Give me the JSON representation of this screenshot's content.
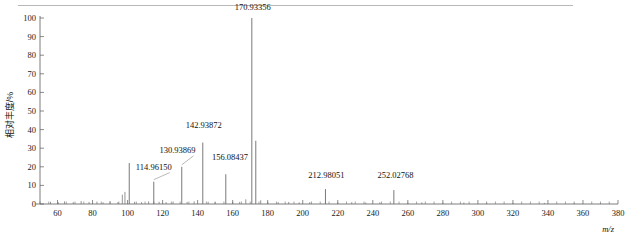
{
  "figure": {
    "name": "mass-spectrum",
    "background": "#ffffff",
    "line_color": "#7a7a7a",
    "text_color": "#111111"
  },
  "chart_data": {
    "type": "bar",
    "title": "",
    "subtitle": "",
    "xlabel": "m/z",
    "ylabel": "相对丰度/%",
    "xlim": [
      50,
      380
    ],
    "ylim": [
      0,
      100
    ],
    "grid": false,
    "legend": null,
    "x_ticks": [
      60,
      80,
      100,
      120,
      140,
      160,
      180,
      200,
      220,
      240,
      260,
      280,
      300,
      320,
      340,
      360,
      380
    ],
    "x_minor_step": 5,
    "y_ticks": [
      0,
      10,
      20,
      30,
      40,
      50,
      60,
      70,
      80,
      90,
      100
    ],
    "x": [
      56.0,
      60.5,
      64.0,
      69.0,
      73.5,
      78.0,
      82.5,
      86.0,
      90.0,
      94.5,
      97.0,
      98.5,
      100.95,
      104.0,
      108.0,
      112.0,
      114.9615,
      118.0,
      122.0,
      126.0,
      130.93869,
      134.0,
      138.0,
      142.93872,
      146.0,
      150.0,
      156.08437,
      160.0,
      164.0,
      167.5,
      170.93356,
      173.2,
      176.0,
      180.0,
      186.0,
      192.0,
      198.0,
      204.0,
      212.98051,
      220.0,
      228.0,
      236.0,
      244.0,
      252.02768,
      260.0,
      268.0,
      280.0,
      292.0,
      305.0,
      320.0,
      338.0,
      355.0,
      370.0
    ],
    "values": [
      1.2,
      0.9,
      1.4,
      1.0,
      1.6,
      1.1,
      1.3,
      0.9,
      1.5,
      1.0,
      5.0,
      6.5,
      22.0,
      1.2,
      1.0,
      1.4,
      12.0,
      1.2,
      1.0,
      1.3,
      20.0,
      1.1,
      1.4,
      33.0,
      1.2,
      1.0,
      16.0,
      1.2,
      1.1,
      2.5,
      100.0,
      34.0,
      2.0,
      1.2,
      1.0,
      1.1,
      0.9,
      1.0,
      8.0,
      0.9,
      1.0,
      0.8,
      0.9,
      7.5,
      0.8,
      0.9,
      0.7,
      0.8,
      0.7,
      0.6,
      0.6,
      0.5,
      0.5
    ],
    "annotations": [
      {
        "label": "114.96150",
        "mz": 114.9615,
        "value": 12.0,
        "label_x": 114.9615,
        "label_y": 18.5,
        "leader": true
      },
      {
        "label": "130.93869",
        "mz": 130.93869,
        "value": 20.0,
        "label_x": 128.5,
        "label_y": 27.5,
        "leader": true
      },
      {
        "label": "142.93872",
        "mz": 142.93872,
        "value": 33.0,
        "label_x": 143.5,
        "label_y": 41.0,
        "leader": false
      },
      {
        "label": "156.08437",
        "mz": 156.08437,
        "value": 16.0,
        "label_x": 158.5,
        "label_y": 23.5,
        "leader": false
      },
      {
        "label": "170.93356",
        "mz": 170.93356,
        "value": 100.0,
        "label_x": 171.5,
        "label_y": 104.5,
        "leader": false
      },
      {
        "label": "212.98051",
        "mz": 212.98051,
        "value": 8.0,
        "label_x": 213.5,
        "label_y": 14.0,
        "leader": false
      },
      {
        "label": "252.02768",
        "mz": 252.02768,
        "value": 7.5,
        "label_x": 253.0,
        "label_y": 14.0,
        "leader": false
      }
    ]
  }
}
